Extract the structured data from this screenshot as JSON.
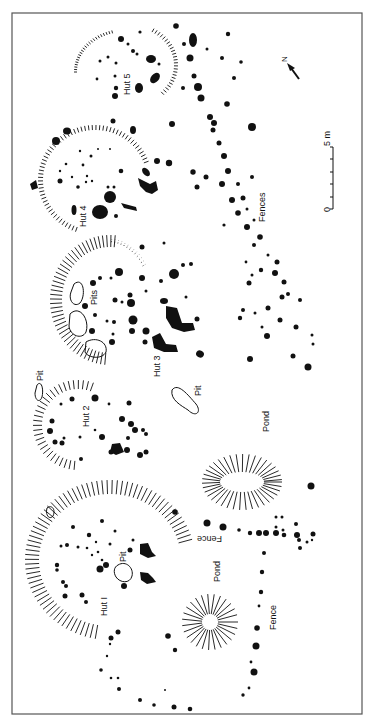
{
  "figure": {
    "type": "archaeological site plan",
    "colors": {
      "ink": "#111111",
      "frame": "#555555",
      "background": "#ffffff"
    }
  },
  "labels": {
    "hut1": "Hut I",
    "hut2": "Hut 2",
    "hut3": "Hut 3",
    "hut4": "Hut 4",
    "hut5": "Hut 5",
    "pits": "Pits",
    "pit_hut1": "Pit",
    "pit_hut2": "Pit",
    "pit_center": "Pit",
    "pond_small": "Pond",
    "pond_large": "Pond",
    "fence_upper": "Fence",
    "fence_lower": "Fence",
    "fences": "Fences"
  },
  "north_arrow": {
    "label": "N",
    "icon": "north-arrow-icon"
  },
  "scale_bar": {
    "start_label": "0",
    "end_label": "5 m",
    "unit": "m",
    "divisions": 5
  }
}
